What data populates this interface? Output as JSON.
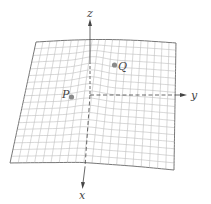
{
  "figure": {
    "axes": {
      "x": {
        "label": "x"
      },
      "y": {
        "label": "y"
      },
      "z": {
        "label": "z"
      }
    },
    "points": [
      {
        "name": "P",
        "label": "P"
      },
      {
        "name": "Q",
        "label": "Q"
      }
    ],
    "colors": {
      "grid": "#b5b5b5",
      "outline": "#777777",
      "axis": "#444444",
      "point": "#8a8a8a"
    }
  }
}
